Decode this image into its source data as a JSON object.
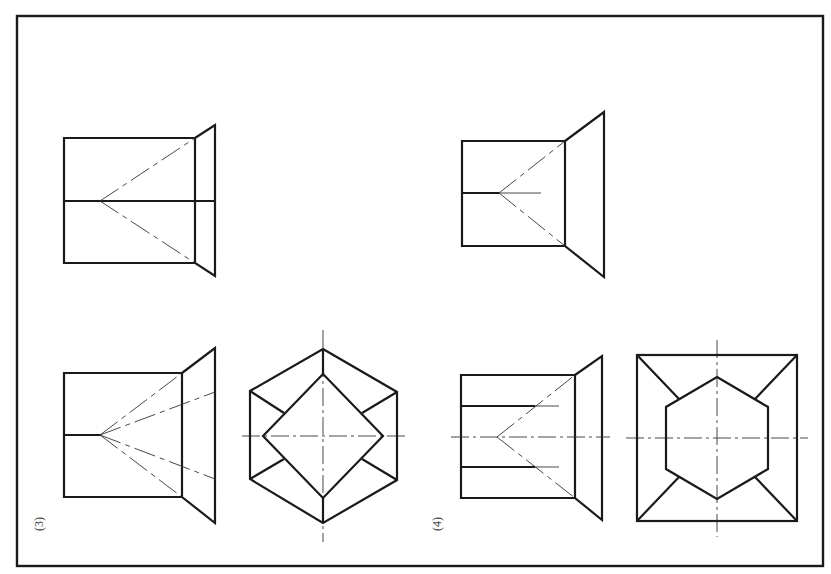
{
  "sheet": {
    "width": 831,
    "height": 574,
    "frame": {
      "x": 17,
      "y": 16,
      "w": 806,
      "h": 550
    },
    "line_color": "#1a1a1a",
    "background": "#ffffff"
  },
  "figures": [
    {
      "id": "fig-1",
      "label": "",
      "description": "Front view: rectangle (cylinder) joined to truncated triangle (cone frustum) with horizontal axis line and dash-dot cone generators"
    },
    {
      "id": "fig-2",
      "label": "",
      "description": "Front view: rectangle joined to triangle with short axis line and dash-dot cone generators"
    },
    {
      "id": "fig-3",
      "label": "(3)",
      "description": "Front view with four cone generator lines; side view: hexagon containing square rotated 45 degrees, with centerlines"
    },
    {
      "id": "fig-4",
      "label": "(4)",
      "description": "Front view with two inner horizontal lines and centerline; side view: square containing hexagon with corner diagonals and centerlines"
    }
  ],
  "labels": {
    "fig3": "(3)",
    "fig4": "(4)"
  }
}
